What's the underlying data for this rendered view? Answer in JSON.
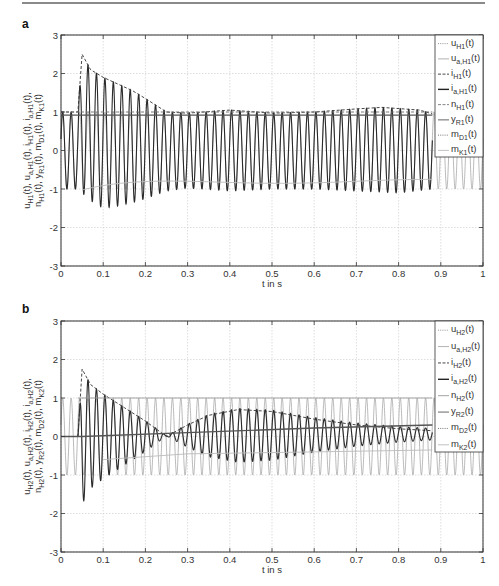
{
  "page": {
    "top_rule": true,
    "panels": [
      {
        "label": "a"
      },
      {
        "label": "b"
      }
    ]
  },
  "chart_data": [
    {
      "panel": "a",
      "type": "line",
      "title": "",
      "xlabel": "t in s",
      "ylabel": "u_H1(t), u_a,H1(t), i_H1(t), i_a,H1(t), n_H1(t), y_R1(t), m_D1(t), m_K1(t)",
      "xlim": [
        0,
        1
      ],
      "ylim": [
        -3,
        3
      ],
      "xticks": [
        "0",
        "0.1",
        "0.2",
        "0.3",
        "0.4",
        "0.5",
        "0.6",
        "0.7",
        "0.8",
        "0.9",
        "1"
      ],
      "yticks": [
        "-3",
        "-2",
        "-1",
        "0",
        "1",
        "2",
        "3"
      ],
      "grid": true,
      "legend_position": "upper right (inside)",
      "legend": [
        {
          "base": "u",
          "sub": "H1",
          "style": "dotted",
          "color": "#888888"
        },
        {
          "base": "u",
          "sub": "a,H1",
          "style": "solid",
          "color": "#aaaaaa"
        },
        {
          "base": "i",
          "sub": "H1",
          "style": "dashed",
          "color": "#333333"
        },
        {
          "base": "i",
          "sub": "a,H1",
          "style": "solid",
          "color": "#222222"
        },
        {
          "base": "n",
          "sub": "H1",
          "style": "dashed",
          "color": "#777777"
        },
        {
          "base": "y",
          "sub": "R1",
          "style": "solid",
          "color": "#555555"
        },
        {
          "base": "m",
          "sub": "D1",
          "style": "dotted",
          "color": "#666666"
        },
        {
          "base": "m",
          "sub": "K1",
          "style": "solid",
          "color": "#bbbbbb"
        }
      ],
      "series": [
        {
          "name": "u_H1(t)",
          "description": "sinusoid amplitude 1, ~50 Hz",
          "amplitude": 1.0,
          "freq_hz": 50
        },
        {
          "name": "i_a,H1(t)",
          "description": "oscillating current, inrush from t≈0.04 s, peak envelope 2.5 at 0.05 decaying to ~1 by 0.25, slight swell to ~1.1 around 0.4 and 0.75",
          "envelope_points": [
            [
              0.0,
              1.0
            ],
            [
              0.04,
              1.0
            ],
            [
              0.05,
              2.5
            ],
            [
              0.07,
              2.1
            ],
            [
              0.1,
              1.9
            ],
            [
              0.13,
              1.75
            ],
            [
              0.17,
              1.55
            ],
            [
              0.2,
              1.35
            ],
            [
              0.25,
              1.0
            ],
            [
              0.3,
              0.97
            ],
            [
              0.4,
              1.05
            ],
            [
              0.5,
              0.97
            ],
            [
              0.6,
              1.0
            ],
            [
              0.7,
              1.08
            ],
            [
              0.76,
              1.12
            ],
            [
              0.85,
              1.05
            ],
            [
              0.88,
              0.95
            ]
          ],
          "lower_envelope_points": [
            [
              0.0,
              -1.0
            ],
            [
              0.04,
              -1.0
            ],
            [
              0.07,
              -1.3
            ],
            [
              0.1,
              -1.5
            ],
            [
              0.13,
              -1.45
            ],
            [
              0.17,
              -1.35
            ],
            [
              0.2,
              -1.25
            ],
            [
              0.25,
              -1.05
            ],
            [
              0.3,
              -0.97
            ],
            [
              0.4,
              -1.05
            ],
            [
              0.5,
              -1.0
            ],
            [
              0.6,
              -1.0
            ],
            [
              0.7,
              -1.05
            ],
            [
              0.8,
              -1.1
            ],
            [
              0.88,
              -1.0
            ]
          ]
        },
        {
          "name": "i_H1(t)",
          "description": "dashed upper envelope tracking current peaks"
        },
        {
          "name": "n_H1(t)",
          "description": "≈1.0 nearly constant with small wiggles",
          "value": 1.0
        },
        {
          "name": "y_R1(t)",
          "description": "≈0.9 nearly constant",
          "value": 0.9
        },
        {
          "name": "m_K1(t)",
          "description": "≈-0.8 after 0.25 s, slowly varying",
          "value": -0.8
        }
      ]
    },
    {
      "panel": "b",
      "type": "line",
      "title": "",
      "xlabel": "t in s",
      "ylabel": "u_H2(t), u_a,H2(t), i_H2(t), i_a,H2(t), n_H2(t), y_R2(t), m_D2(t), m_K2(t)",
      "xlim": [
        0,
        1
      ],
      "ylim": [
        -3,
        3
      ],
      "xticks": [
        "0",
        "0.1",
        "0.2",
        "0.3",
        "0.4",
        "0.5",
        "0.6",
        "0.7",
        "0.8",
        "0.9",
        "1"
      ],
      "yticks": [
        "-3",
        "-2",
        "-1",
        "0",
        "1",
        "2",
        "3"
      ],
      "grid": true,
      "legend_position": "upper right (inside)",
      "legend": [
        {
          "base": "u",
          "sub": "H2",
          "style": "dotted",
          "color": "#888888"
        },
        {
          "base": "u",
          "sub": "a,H2",
          "style": "solid",
          "color": "#aaaaaa"
        },
        {
          "base": "i",
          "sub": "H2",
          "style": "dashed",
          "color": "#333333"
        },
        {
          "base": "i",
          "sub": "a,H2",
          "style": "solid",
          "color": "#222222"
        },
        {
          "base": "n",
          "sub": "H2",
          "style": "solid",
          "color": "#999999"
        },
        {
          "base": "y",
          "sub": "R2",
          "style": "solid",
          "color": "#555555"
        },
        {
          "base": "m",
          "sub": "D2",
          "style": "dotted",
          "color": "#666666"
        },
        {
          "base": "m",
          "sub": "K2",
          "style": "solid",
          "color": "#bbbbbb"
        }
      ],
      "series": [
        {
          "name": "u_H2(t)",
          "description": "sinusoid amplitude 1, ~50 Hz over whole range",
          "amplitude": 1.0,
          "freq_hz": 50
        },
        {
          "name": "i_a,H2(t)",
          "description": "starts 0, inrush at 0.04 s peak 1.75 / -1.8, decays to ~0 at 0.25, grows to envelope ~0.7 around 0.42, decays to ~0.15 by 0.85",
          "envelope_points": [
            [
              0.0,
              0.0
            ],
            [
              0.04,
              0.0
            ],
            [
              0.05,
              1.75
            ],
            [
              0.07,
              1.35
            ],
            [
              0.1,
              1.1
            ],
            [
              0.15,
              0.75
            ],
            [
              0.2,
              0.4
            ],
            [
              0.25,
              0.0
            ],
            [
              0.3,
              0.3
            ],
            [
              0.35,
              0.55
            ],
            [
              0.42,
              0.7
            ],
            [
              0.5,
              0.65
            ],
            [
              0.6,
              0.45
            ],
            [
              0.7,
              0.3
            ],
            [
              0.8,
              0.2
            ],
            [
              0.88,
              0.15
            ]
          ]
        },
        {
          "name": "i_H2(t)",
          "description": "dashed envelope tracking current peaks"
        },
        {
          "name": "n_H2(t)",
          "description": "≈1.0 after 0.1 s",
          "value": 1.0
        },
        {
          "name": "y_R2(t)",
          "description": "rises from 0 at 0.05 to ~0.3 at 0.88",
          "points": [
            [
              0.0,
              0.0
            ],
            [
              0.05,
              0.0
            ],
            [
              0.3,
              0.1
            ],
            [
              0.6,
              0.22
            ],
            [
              0.88,
              0.3
            ]
          ]
        },
        {
          "name": "m_K2(t)",
          "description": "from -0.6 at 0.1 tending toward -0.35 near 0.88",
          "points": [
            [
              0.1,
              -0.6
            ],
            [
              0.3,
              -0.45
            ],
            [
              0.6,
              -0.4
            ],
            [
              0.88,
              -0.35
            ]
          ]
        }
      ]
    }
  ]
}
